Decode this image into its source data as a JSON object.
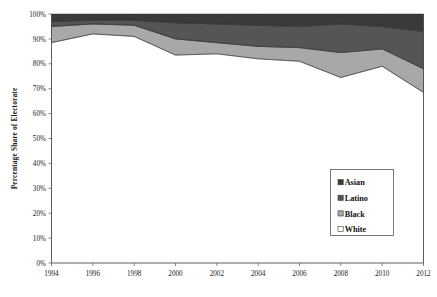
{
  "chart_data": {
    "type": "area",
    "stacked": true,
    "title": "",
    "subtitle": "",
    "xlabel": "",
    "ylabel": "Percentage Share of Electorate",
    "x": [
      1994,
      1996,
      1998,
      2000,
      2002,
      2004,
      2006,
      2008,
      2010,
      2012
    ],
    "categories": [
      "1994",
      "1996",
      "1998",
      "2000",
      "2002",
      "2004",
      "2006",
      "2008",
      "2010",
      "2012"
    ],
    "xlim": [
      1994,
      2012
    ],
    "ylim": [
      0,
      100
    ],
    "y_tick_labels": [
      "0%",
      "10%",
      "20%",
      "30%",
      "40%",
      "50%",
      "60%",
      "70%",
      "80%",
      "90%",
      "100%"
    ],
    "y_tick_values": [
      0,
      10,
      20,
      30,
      40,
      50,
      60,
      70,
      80,
      90,
      100
    ],
    "x_tick_labels": [
      "1994",
      "1996",
      "1998",
      "2000",
      "2002",
      "2004",
      "2006",
      "2008",
      "2010",
      "2012"
    ],
    "grid": false,
    "legend_position": "inside-right",
    "series": [
      {
        "name": "White",
        "color": "#ffffff",
        "values": [
          88.5,
          92.0,
          91.0,
          83.5,
          84.0,
          82.0,
          81.0,
          74.5,
          79.0,
          68.5
        ],
        "cumulative_top": [
          88.5,
          92.0,
          91.0,
          83.5,
          84.0,
          82.0,
          81.0,
          74.5,
          79.0,
          68.5
        ]
      },
      {
        "name": "Black",
        "color": "#a8a8a8",
        "values": [
          6.5,
          4.0,
          4.5,
          6.5,
          4.5,
          5.0,
          5.5,
          10.0,
          7.0,
          9.5
        ],
        "cumulative_top": [
          95.0,
          96.0,
          95.5,
          90.0,
          88.5,
          87.0,
          86.5,
          84.5,
          86.0,
          78.0
        ]
      },
      {
        "name": "Latino",
        "color": "#555555",
        "values": [
          2.0,
          1.5,
          2.0,
          6.5,
          7.5,
          8.5,
          8.5,
          11.5,
          9.0,
          15.0
        ],
        "cumulative_top": [
          97.0,
          97.5,
          97.5,
          96.5,
          96.0,
          95.5,
          95.0,
          96.0,
          95.0,
          93.0
        ]
      },
      {
        "name": "Asian",
        "color": "#3a3a3a",
        "values": [
          3.0,
          2.5,
          2.5,
          3.5,
          4.0,
          4.5,
          5.0,
          4.0,
          5.0,
          7.0
        ],
        "cumulative_top": [
          100,
          100,
          100,
          100,
          100,
          100,
          100,
          100,
          100,
          100
        ]
      }
    ],
    "legend_entries": [
      {
        "label": "Asian",
        "color": "#3a3a3a"
      },
      {
        "label": "Latino",
        "color": "#555555"
      },
      {
        "label": "Black",
        "color": "#a8a8a8"
      },
      {
        "label": "White",
        "color": "#ffffff"
      }
    ]
  }
}
